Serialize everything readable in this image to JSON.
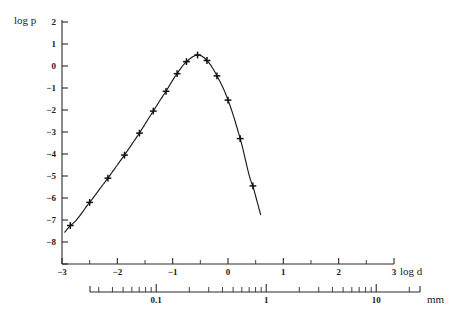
{
  "chart_data": {
    "type": "line",
    "title": "",
    "xlabel": "log d",
    "ylabel": "log p",
    "xlim": [
      -3,
      3
    ],
    "ylim": [
      -9,
      2
    ],
    "grid": false,
    "legend": null,
    "x_ticks": [
      -3,
      -2,
      -1,
      0,
      1,
      2,
      3
    ],
    "x_tick_labels": [
      "-3",
      "-2",
      "-1",
      "0",
      "1",
      "2",
      "3"
    ],
    "y_ticks": [
      2,
      1,
      0,
      -1,
      -2,
      -3,
      -4,
      -5,
      -6,
      -7,
      -8,
      -9
    ],
    "y_tick_labels": [
      "2",
      "1",
      "0",
      "-1",
      "-2",
      "-3",
      "-4",
      "-5",
      "-6",
      "-7",
      "-8",
      "-9"
    ],
    "secondary_axis": {
      "label": "mm",
      "type": "log",
      "major_labels": [
        "0.1",
        "1",
        "10"
      ],
      "major_values": [
        0.1,
        1,
        10
      ],
      "minor_values": [
        0.02,
        0.03,
        0.04,
        0.05,
        0.06,
        0.07,
        0.08,
        0.09,
        0.2,
        0.3,
        0.4,
        0.5,
        0.6,
        0.7,
        0.8,
        0.9,
        2,
        3,
        4,
        5,
        6,
        7,
        8,
        9,
        20
      ]
    },
    "series": [
      {
        "name": "measured",
        "marker": "plus",
        "x": [
          -2.85,
          -2.5,
          -2.17,
          -1.87,
          -1.6,
          -1.35,
          -1.12,
          -0.92,
          -0.75,
          -0.55,
          -0.38,
          -0.2,
          0.0,
          0.22,
          0.45
        ],
        "y": [
          -7.25,
          -6.2,
          -5.1,
          -4.05,
          -3.05,
          -2.05,
          -1.15,
          -0.35,
          0.2,
          0.5,
          0.25,
          -0.45,
          -1.55,
          -3.3,
          -5.45
        ]
      }
    ],
    "fit_curve": {
      "name": "fitted distribution",
      "x_start": -2.95,
      "x_end": 0.6,
      "peak_x": -0.55,
      "peak_y": 0.52
    }
  },
  "axes": {
    "y_axis_caption": "log p",
    "x_axis_caption": "log d",
    "secondary_caption": "mm"
  }
}
